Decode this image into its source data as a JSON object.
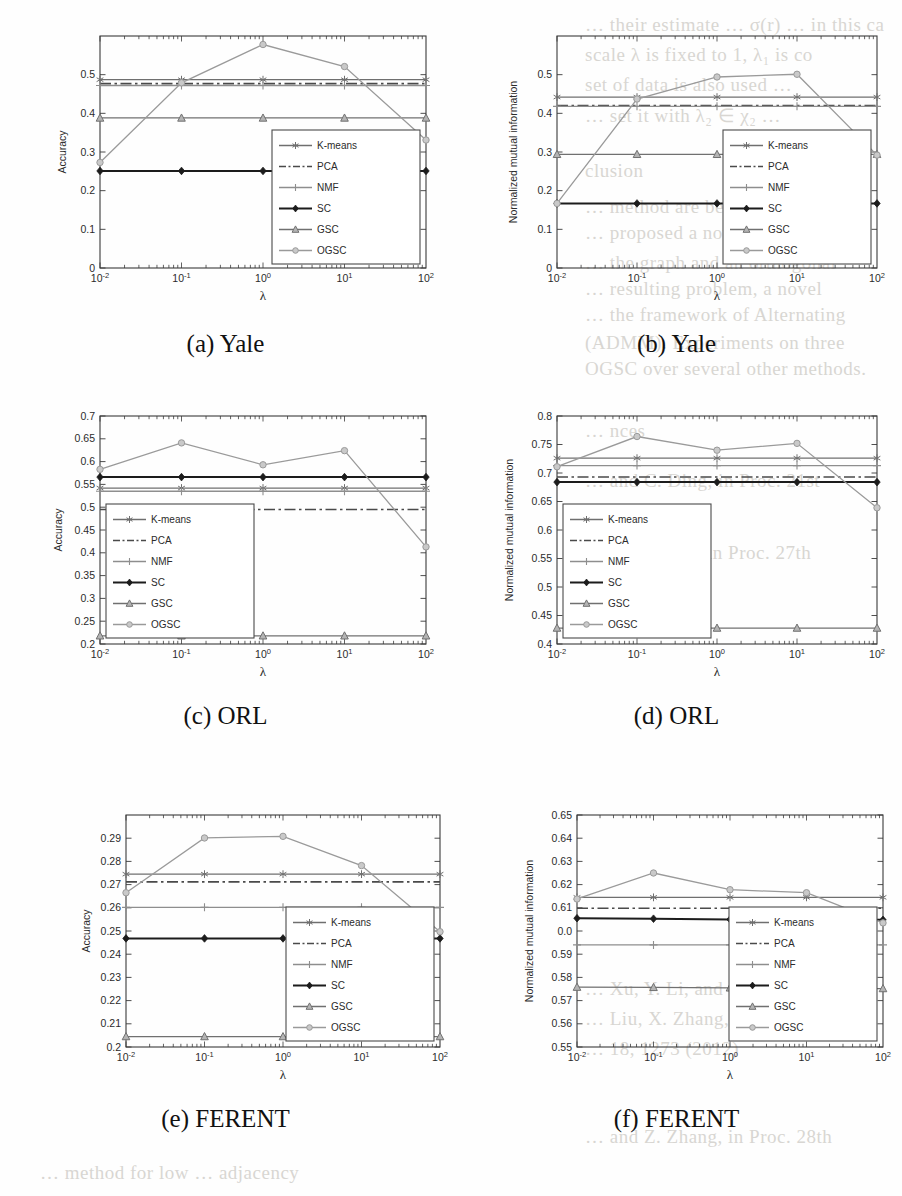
{
  "figure": {
    "background_bleed": [
      {
        "text": "… their estimate … σ(r) … in this ca",
        "x": 585,
        "y": 14
      },
      {
        "text": "scale λ is fixed to 1, λ₁ is co",
        "x": 585,
        "y": 44
      },
      {
        "text": "set of data is also used …",
        "x": 585,
        "y": 74
      },
      {
        "text": "… set it with λ₂ ∈ χ₂ …",
        "x": 585,
        "y": 104
      },
      {
        "text": "clusion",
        "x": 585,
        "y": 160
      },
      {
        "text": "… method are being presented",
        "x": 585,
        "y": 196
      },
      {
        "text": "… proposed a novel formulation",
        "x": 585,
        "y": 222
      },
      {
        "text": "… the graph and an orthogonal",
        "x": 585,
        "y": 252
      },
      {
        "text": "… resulting problem, a novel",
        "x": 585,
        "y": 278
      },
      {
        "text": "… the framework of Alternating",
        "x": 585,
        "y": 304
      },
      {
        "text": "(ADMM). Experiments on three",
        "x": 585,
        "y": 332
      },
      {
        "text": "OGSC over several other methods.",
        "x": 585,
        "y": 358
      },
      {
        "text": "… nces",
        "x": 585,
        "y": 420
      },
      {
        "text": "… and C. Ding, in Proc. 21st",
        "x": 585,
        "y": 470
      },
      {
        "text": "… (2014)",
        "x": 585,
        "y": 500
      },
      {
        "text": "… and D. Cai, in Proc. 27th",
        "x": 585,
        "y": 542
      },
      {
        "text": "… (2013)",
        "x": 585,
        "y": 572
      },
      {
        "text": "… Xu, Y. Li, and S. Yan (2016)",
        "x": 585,
        "y": 978
      },
      {
        "text": "… Liu, X. Zhang, and T. Huang, in",
        "x": 585,
        "y": 1008
      },
      {
        "text": "… 18, 1273 (2012)",
        "x": 585,
        "y": 1038
      },
      {
        "text": "… and Z. Zhang, in Proc. 28th",
        "x": 585,
        "y": 1126
      },
      {
        "text": "… method for low … adjacency",
        "x": 40,
        "y": 1162
      }
    ],
    "colors": {
      "kmeans": "#6f6f6f",
      "pca": "#4a4a4a",
      "nmf": "#8e8e8e",
      "sc": "#1c1c1c",
      "gsc": "#707070",
      "ogsc": "#9a9a9a",
      "axis": "#3a3a3a",
      "legend_border": "#4a4a4a",
      "legend_bg": "#ffffff"
    },
    "legend_entries": [
      {
        "label": "K-means",
        "style": "solid",
        "marker": "star",
        "color_key": "kmeans"
      },
      {
        "label": "PCA",
        "style": "dashdot",
        "marker": "none",
        "color_key": "pca"
      },
      {
        "label": "NMF",
        "style": "solid",
        "marker": "plus",
        "color_key": "nmf"
      },
      {
        "label": "SC",
        "style": "solid",
        "marker": "diamond",
        "color_key": "sc"
      },
      {
        "label": "GSC",
        "style": "solid",
        "marker": "triangle",
        "color_key": "gsc"
      },
      {
        "label": "OGSC",
        "style": "solid",
        "marker": "circle",
        "color_key": "ogsc"
      }
    ],
    "xlabel": "λ",
    "xtick_labels": [
      "10⁻²",
      "10⁻¹",
      "10⁰",
      "10¹",
      "10²"
    ],
    "xtick_bases": [
      "10",
      "10",
      "10",
      "10",
      "10"
    ],
    "xtick_exps": [
      "-2",
      "-1",
      "0",
      "1",
      "2"
    ]
  },
  "chart_data": [
    {
      "id": "a",
      "type": "line",
      "title": "(a) Yale",
      "caption": "(a) Yale",
      "xlabel": "λ",
      "ylabel": "Accuracy",
      "x": [
        0.01,
        0.1,
        1,
        10,
        100
      ],
      "xscale": "log",
      "xlim": [
        0.01,
        100
      ],
      "ylim": [
        0,
        0.6
      ],
      "yticks": [
        0,
        0.1,
        0.2,
        0.3,
        0.4,
        0.5
      ],
      "ytick_labels": [
        "0",
        "0.1",
        "0.2",
        "0.3",
        "0.4",
        "0.5"
      ],
      "grid": false,
      "legend_position": "lower-right",
      "series": [
        {
          "name": "K-means",
          "values": [
            0.487,
            0.487,
            0.487,
            0.487,
            0.487
          ]
        },
        {
          "name": "PCA",
          "values": [
            0.477,
            0.477,
            0.477,
            0.477,
            0.477
          ]
        },
        {
          "name": "NMF",
          "values": [
            0.472,
            0.472,
            0.472,
            0.472,
            0.472
          ]
        },
        {
          "name": "SC",
          "values": [
            0.251,
            0.251,
            0.251,
            0.251,
            0.251
          ]
        },
        {
          "name": "GSC",
          "values": [
            0.388,
            0.388,
            0.388,
            0.388,
            0.388
          ]
        },
        {
          "name": "OGSC",
          "values": [
            0.273,
            0.479,
            0.578,
            0.521,
            0.331
          ]
        }
      ]
    },
    {
      "id": "b",
      "type": "line",
      "title": "(b) Yale",
      "caption": "(b) Yale",
      "xlabel": "λ",
      "ylabel": "Normalized mutual information",
      "x": [
        0.01,
        0.1,
        1,
        10,
        100
      ],
      "xscale": "log",
      "xlim": [
        0.01,
        100
      ],
      "ylim": [
        0,
        0.6
      ],
      "yticks": [
        0,
        0.1,
        0.2,
        0.3,
        0.4,
        0.5
      ],
      "ytick_labels": [
        "0",
        "0.1",
        "0.2",
        "0.3",
        "0.4",
        "0.5"
      ],
      "grid": false,
      "legend_position": "lower-right",
      "series": [
        {
          "name": "K-means",
          "values": [
            0.442,
            0.442,
            0.442,
            0.442,
            0.442
          ]
        },
        {
          "name": "PCA",
          "values": [
            0.42,
            0.42,
            0.42,
            0.42,
            0.42
          ]
        },
        {
          "name": "NMF",
          "values": [
            0.418,
            0.418,
            0.418,
            0.418,
            0.418
          ]
        },
        {
          "name": "SC",
          "values": [
            0.167,
            0.167,
            0.167,
            0.167,
            0.167
          ]
        },
        {
          "name": "GSC",
          "values": [
            0.294,
            0.294,
            0.294,
            0.294,
            0.294
          ]
        },
        {
          "name": "OGSC",
          "values": [
            0.167,
            0.437,
            0.494,
            0.501,
            0.292
          ]
        }
      ]
    },
    {
      "id": "c",
      "type": "line",
      "title": "(c) ORL",
      "caption": "(c) ORL",
      "xlabel": "λ",
      "ylabel": "Accuracy",
      "x": [
        0.01,
        0.1,
        1,
        10,
        100
      ],
      "xscale": "log",
      "xlim": [
        0.01,
        100
      ],
      "ylim": [
        0.2,
        0.7
      ],
      "yticks": [
        0.2,
        0.25,
        0.3,
        0.35,
        0.4,
        0.45,
        0.5,
        0.55,
        0.6,
        0.65,
        0.7
      ],
      "ytick_labels": [
        "0.2",
        "0.25",
        "0.3",
        "0.35",
        "0.4",
        "0.45",
        "0.5",
        "0.55",
        "0.6",
        "0.65",
        "0.7"
      ],
      "grid": false,
      "legend_position": "lower-left",
      "series": [
        {
          "name": "K-means",
          "values": [
            0.542,
            0.542,
            0.542,
            0.542,
            0.542
          ]
        },
        {
          "name": "PCA",
          "values": [
            0.495,
            0.495,
            0.495,
            0.495,
            0.495
          ]
        },
        {
          "name": "NMF",
          "values": [
            0.535,
            0.535,
            0.535,
            0.535,
            0.535
          ]
        },
        {
          "name": "SC",
          "values": [
            0.566,
            0.566,
            0.566,
            0.566,
            0.566
          ]
        },
        {
          "name": "GSC",
          "values": [
            0.218,
            0.218,
            0.218,
            0.218,
            0.218
          ]
        },
        {
          "name": "OGSC",
          "values": [
            0.583,
            0.641,
            0.593,
            0.624,
            0.413
          ]
        }
      ]
    },
    {
      "id": "d",
      "type": "line",
      "title": "(d) ORL",
      "caption": "(d) ORL",
      "xlabel": "λ",
      "ylabel": "Normalized mutual information",
      "x": [
        0.01,
        0.1,
        1,
        10,
        100
      ],
      "xscale": "log",
      "xlim": [
        0.4,
        0.8
      ],
      "ylim": [
        0.4,
        0.8
      ],
      "yticks": [
        0.4,
        0.45,
        0.5,
        0.55,
        0.6,
        0.65,
        0.7,
        0.75,
        0.8
      ],
      "ytick_labels": [
        "0.4",
        "0.45",
        "0.5",
        "0.55",
        "0.6",
        "0.65",
        "0.7",
        "0.75",
        "0.8"
      ],
      "grid": false,
      "legend_position": "lower-left",
      "series": [
        {
          "name": "K-means",
          "values": [
            0.726,
            0.726,
            0.726,
            0.726,
            0.726
          ]
        },
        {
          "name": "PCA",
          "values": [
            0.693,
            0.693,
            0.693,
            0.693,
            0.693
          ]
        },
        {
          "name": "NMF",
          "values": [
            0.713,
            0.713,
            0.713,
            0.713,
            0.713
          ]
        },
        {
          "name": "SC",
          "values": [
            0.684,
            0.684,
            0.684,
            0.684,
            0.684
          ]
        },
        {
          "name": "GSC",
          "values": [
            0.428,
            0.428,
            0.428,
            0.428,
            0.428
          ]
        },
        {
          "name": "OGSC",
          "values": [
            0.711,
            0.764,
            0.74,
            0.752,
            0.639
          ]
        }
      ]
    },
    {
      "id": "e",
      "type": "line",
      "title": "(e) FERENT",
      "caption": "(e) FERENT",
      "xlabel": "λ",
      "ylabel": "Accuracy",
      "x": [
        0.01,
        0.1,
        1,
        10,
        100
      ],
      "xscale": "log",
      "xlim": [
        0.01,
        100
      ],
      "ylim": [
        0.2,
        0.3
      ],
      "yticks": [
        0.2,
        0.21,
        0.22,
        0.23,
        0.24,
        0.25,
        0.26,
        0.27,
        0.28,
        0.29
      ],
      "ytick_labels": [
        "0.2",
        "0.21",
        "0.22",
        "0.23",
        "0.24",
        "0.25",
        "0.26",
        "0.27",
        "0.28",
        "0.29"
      ],
      "grid": false,
      "legend_position": "lower-right",
      "series": [
        {
          "name": "K-means",
          "values": [
            0.2745,
            0.2745,
            0.2745,
            0.2745,
            0.2745
          ]
        },
        {
          "name": "PCA",
          "values": [
            0.2712,
            0.2712,
            0.2712,
            0.2712,
            0.2712
          ]
        },
        {
          "name": "NMF",
          "values": [
            0.2602,
            0.2602,
            0.2602,
            0.2602,
            0.2602
          ]
        },
        {
          "name": "SC",
          "values": [
            0.2468,
            0.2468,
            0.2468,
            0.2468,
            0.2468
          ]
        },
        {
          "name": "GSC",
          "values": [
            0.2045,
            0.2045,
            0.2045,
            0.2045,
            0.2045
          ]
        },
        {
          "name": "OGSC",
          "values": [
            0.2665,
            0.2901,
            0.2908,
            0.2782,
            0.2497
          ]
        }
      ]
    },
    {
      "id": "f",
      "type": "line",
      "title": "(f) FERENT",
      "caption": "(f) FERENT",
      "xlabel": "λ",
      "ylabel": "Normalized mutual information",
      "x": [
        0.01,
        0.1,
        1,
        10,
        100
      ],
      "xscale": "log",
      "xlim": [
        0.01,
        100
      ],
      "ylim": [
        0.55,
        0.65
      ],
      "yticks": [
        0.55,
        0.56,
        0.57,
        0.58,
        0.59,
        0.6,
        0.61,
        0.62,
        0.63,
        0.64,
        0.65
      ],
      "ytick_labels": [
        "0.55",
        "0.56",
        "0.57",
        "0.58",
        "0.59",
        "0.0",
        "0.61",
        "0.62",
        "0.63",
        "0.64",
        "0.65"
      ],
      "grid": false,
      "legend_position": "lower-right",
      "series": [
        {
          "name": "K-means",
          "values": [
            0.6145,
            0.6145,
            0.6145,
            0.6145,
            0.6145
          ]
        },
        {
          "name": "PCA",
          "values": [
            0.6098,
            0.6098,
            0.6098,
            0.6098,
            0.6098
          ]
        },
        {
          "name": "NMF",
          "values": [
            0.594,
            0.594,
            0.594,
            0.594,
            0.594
          ]
        },
        {
          "name": "SC",
          "values": [
            0.6055,
            0.6053,
            0.605,
            0.605,
            0.6048
          ]
        },
        {
          "name": "GSC",
          "values": [
            0.5758,
            0.5757,
            0.5755,
            0.5753,
            0.5752
          ]
        },
        {
          "name": "OGSC",
          "values": [
            0.6138,
            0.625,
            0.6178,
            0.6165,
            0.6035
          ]
        }
      ]
    }
  ]
}
